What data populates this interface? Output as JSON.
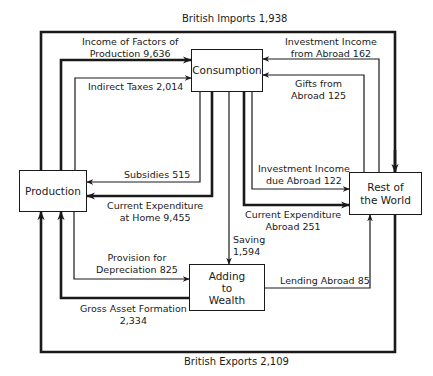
{
  "nodes": {
    "consumption": {
      "label": "Consumption"
    },
    "production": {
      "label": "Production"
    },
    "rest_of_world": {
      "line1": "Rest of",
      "line2": "the World"
    },
    "adding_to_wealth": {
      "line1": "Adding",
      "line2": "to",
      "line3": "Wealth"
    }
  },
  "flows": {
    "british_imports": {
      "label": "British Imports  1,938",
      "from": "Rest of the World",
      "to": "Production",
      "weight": "thick"
    },
    "british_exports": {
      "label": "British Exports  2,109",
      "from": "Rest of the World",
      "to": "Production",
      "weight": "thick"
    },
    "income_of_factors": {
      "line1": "Income of Factors of",
      "line2": "Production 9,636",
      "from": "Production",
      "to": "Consumption",
      "weight": "thick"
    },
    "indirect_taxes": {
      "label": "Indirect Taxes 2,014",
      "from": "Production",
      "to": "Consumption",
      "weight": "thin"
    },
    "investment_income_from_abroad": {
      "line1": "Investment Income",
      "line2": "from Abroad 162",
      "from": "Rest of the World",
      "to": "Consumption",
      "weight": "thin"
    },
    "gifts_from_abroad": {
      "line1": "Gifts from",
      "line2": "Abroad 125",
      "from": "Rest of the World",
      "to": "Consumption",
      "weight": "thin"
    },
    "subsidies": {
      "label": "Subsidies 515",
      "from": "Consumption",
      "to": "Production",
      "weight": "thin"
    },
    "current_expenditure_home": {
      "line1": "Current Expenditure",
      "line2": "at Home 9,455",
      "from": "Consumption",
      "to": "Production",
      "weight": "thick"
    },
    "investment_income_due_abroad": {
      "line1": "Investment Income",
      "line2": "due Abroad 122",
      "from": "Consumption",
      "to": "Rest of the World",
      "weight": "thin"
    },
    "current_expenditure_abroad": {
      "line1": "Current Expenditure",
      "line2": "Abroad 251",
      "from": "Consumption",
      "to": "Rest of the World",
      "weight": "thick"
    },
    "saving": {
      "line1": "Saving",
      "line2": "1,594",
      "from": "Consumption",
      "to": "Adding to Wealth",
      "weight": "thin"
    },
    "provision_for_depreciation": {
      "line1": "Provision for",
      "line2": "Depreciation 825",
      "from": "Production",
      "to": "Adding to Wealth",
      "weight": "thin"
    },
    "gross_asset_formation": {
      "line1": "Gross Asset Formation",
      "line2": "2,334",
      "from": "Adding to Wealth",
      "to": "Production",
      "weight": "thick"
    },
    "lending_abroad": {
      "label": "Lending Abroad 85",
      "from": "Adding to Wealth",
      "to": "Rest of the World",
      "weight": "thin"
    }
  },
  "colors": {
    "ink": "#1a1a1a",
    "background": "#ffffff"
  }
}
